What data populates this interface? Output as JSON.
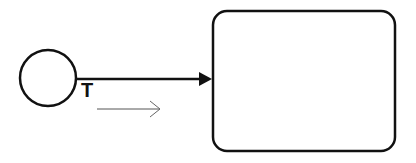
{
  "diagram": {
    "type": "bpmn-flow",
    "start_event": {
      "shape": "circle",
      "label": ""
    },
    "sequence_flow": {
      "label": "T",
      "direction": "right"
    },
    "task": {
      "shape": "rounded-rectangle",
      "label": ""
    },
    "direction_hint": {
      "shape": "open-arrow",
      "direction": "right"
    }
  },
  "colors": {
    "stroke": "#111111",
    "hint": "#666666",
    "background": "#ffffff"
  }
}
